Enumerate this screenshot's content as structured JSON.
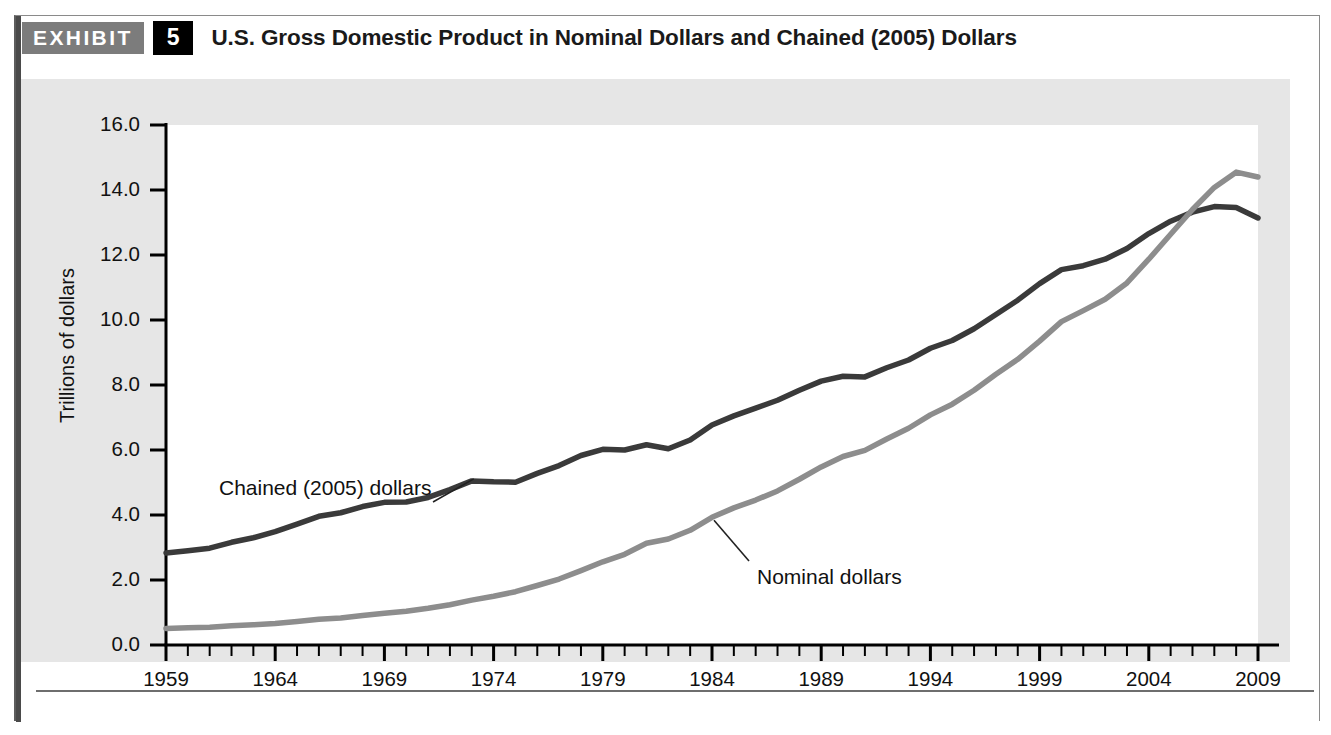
{
  "exhibit": {
    "badge_label": "EXHIBIT",
    "number": "5",
    "title": "U.S. Gross Domestic Product in Nominal Dollars and Chained (2005) Dollars"
  },
  "colors": {
    "panel_background": "#e6e6e6",
    "plot_background": "#ffffff",
    "chained_line": "#3a3a3a",
    "nominal_line": "#8d8d8d",
    "axis": "#000000",
    "badge_gray": "#7c7c7c",
    "badge_black": "#000000",
    "frame_border": "#8a8a8a"
  },
  "chart_data": {
    "type": "line",
    "title": "U.S. Gross Domestic Product in Nominal Dollars and Chained (2005) Dollars",
    "xlabel": "",
    "ylabel": "Trillions of dollars",
    "xlim": [
      1959,
      2009
    ],
    "ylim": [
      0.0,
      16.0
    ],
    "grid": false,
    "legend": "annotated-inline",
    "y_ticks": [
      "0.0",
      "2.0",
      "4.0",
      "6.0",
      "8.0",
      "10.0",
      "12.0",
      "14.0",
      "16.0"
    ],
    "y_tick_values": [
      0.0,
      2.0,
      4.0,
      6.0,
      8.0,
      10.0,
      12.0,
      14.0,
      16.0
    ],
    "x_ticks": [
      "1959",
      "1964",
      "1969",
      "1974",
      "1979",
      "1984",
      "1989",
      "1994",
      "1999",
      "2004",
      "2009"
    ],
    "x_tick_values": [
      1959,
      1964,
      1969,
      1974,
      1979,
      1984,
      1989,
      1994,
      1999,
      2004,
      2009
    ],
    "x_minor_tick_step": 1,
    "x": [
      1959,
      1960,
      1961,
      1962,
      1963,
      1964,
      1965,
      1966,
      1967,
      1968,
      1969,
      1970,
      1971,
      1972,
      1973,
      1974,
      1975,
      1976,
      1977,
      1978,
      1979,
      1980,
      1981,
      1982,
      1983,
      1984,
      1985,
      1986,
      1987,
      1988,
      1989,
      1990,
      1991,
      1992,
      1993,
      1994,
      1995,
      1996,
      1997,
      1998,
      1999,
      2000,
      2001,
      2002,
      2003,
      2004,
      2005,
      2006,
      2007,
      2008,
      2009
    ],
    "series": [
      {
        "name": "Chained (2005) dollars",
        "color": "#3a3a3a",
        "annotation": "Chained (2005) dollars",
        "values": [
          2.83,
          2.9,
          2.98,
          3.16,
          3.3,
          3.49,
          3.72,
          3.96,
          4.07,
          4.26,
          4.39,
          4.4,
          4.54,
          4.78,
          5.05,
          5.02,
          5.01,
          5.28,
          5.52,
          5.83,
          6.02,
          6.0,
          6.16,
          6.04,
          6.31,
          6.77,
          7.05,
          7.29,
          7.53,
          7.84,
          8.12,
          8.27,
          8.25,
          8.53,
          8.77,
          9.13,
          9.37,
          9.73,
          10.17,
          10.61,
          11.12,
          11.55,
          11.67,
          11.87,
          12.2,
          12.66,
          13.04,
          13.32,
          13.49,
          13.46,
          13.14
        ]
      },
      {
        "name": "Nominal dollars",
        "color": "#8d8d8d",
        "annotation": "Nominal dollars",
        "values": [
          0.51,
          0.53,
          0.55,
          0.59,
          0.62,
          0.66,
          0.72,
          0.79,
          0.83,
          0.91,
          0.98,
          1.04,
          1.13,
          1.24,
          1.38,
          1.5,
          1.64,
          1.83,
          2.03,
          2.29,
          2.56,
          2.79,
          3.13,
          3.26,
          3.53,
          3.93,
          4.22,
          4.46,
          4.74,
          5.1,
          5.48,
          5.8,
          5.99,
          6.34,
          6.67,
          7.08,
          7.41,
          7.84,
          8.33,
          8.79,
          9.35,
          9.95,
          10.29,
          10.64,
          11.14,
          11.87,
          12.64,
          13.4,
          14.08,
          14.55,
          14.4
        ]
      }
    ],
    "annotations": [
      {
        "text": "Chained (2005) dollars",
        "points_to_year": 1973,
        "points_to_value": 5.05
      },
      {
        "text": "Nominal dollars",
        "points_to_year": 1984,
        "points_to_value": 3.93
      }
    ]
  }
}
